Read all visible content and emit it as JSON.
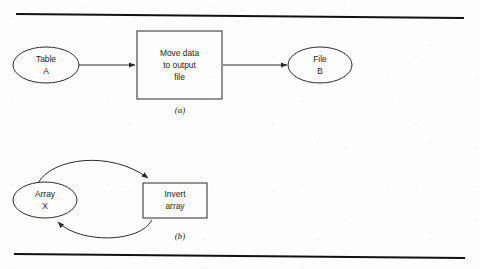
{
  "page": {
    "width": 480,
    "height": 269,
    "background_color": "#fdfdfd",
    "ink_color": "#2b2b2b",
    "rule_color": "#111111"
  },
  "rules": {
    "top": {
      "x1": 16,
      "y1": 14,
      "x2": 464,
      "y2": 18
    },
    "bottom": {
      "x1": 14,
      "y1": 254,
      "x2": 465,
      "y2": 258
    }
  },
  "figures": [
    {
      "id": "figure-a",
      "caption": "(a)",
      "caption_x": 180,
      "caption_y": 113,
      "nodes": [
        {
          "id": "table-a",
          "type": "ellipse",
          "lines": [
            "Table",
            "A"
          ],
          "cx": 46,
          "cy": 65,
          "rx": 33,
          "ry": 18
        },
        {
          "id": "move-data-process",
          "type": "rect",
          "lines": [
            "Move data",
            "to output",
            "file"
          ],
          "x": 137,
          "y": 31,
          "width": 85,
          "height": 68
        },
        {
          "id": "file-b",
          "type": "ellipse",
          "lines": [
            "File",
            "B"
          ],
          "cx": 320,
          "cy": 65,
          "rx": 32,
          "ry": 18
        }
      ],
      "arrows": [
        {
          "id": "arrow-table-a-to-process",
          "from": "table-a",
          "to": "move-data-process",
          "shape": "straight",
          "x1": 79,
          "y1": 65,
          "x2": 136,
          "y2": 65
        },
        {
          "id": "arrow-process-to-file-b",
          "from": "move-data-process",
          "to": "file-b",
          "shape": "straight",
          "x1": 223,
          "y1": 65,
          "x2": 288,
          "y2": 65
        }
      ]
    },
    {
      "id": "figure-b",
      "caption": "(b)",
      "caption_x": 180,
      "caption_y": 239,
      "nodes": [
        {
          "id": "array-x",
          "type": "ellipse",
          "lines": [
            "Array",
            "X"
          ],
          "cx": 45,
          "cy": 200,
          "rx": 32,
          "ry": 18
        },
        {
          "id": "invert-array-process",
          "type": "rect",
          "lines": [
            "Invert",
            "array"
          ],
          "x": 143,
          "y": 183,
          "width": 64,
          "height": 35
        }
      ],
      "arrows": [
        {
          "id": "arrow-array-x-to-process",
          "from": "array-x",
          "to": "invert-array-process",
          "shape": "curve-top"
        },
        {
          "id": "arrow-process-to-array-x",
          "from": "invert-array-process",
          "to": "array-x",
          "shape": "curve-bottom"
        }
      ]
    }
  ]
}
